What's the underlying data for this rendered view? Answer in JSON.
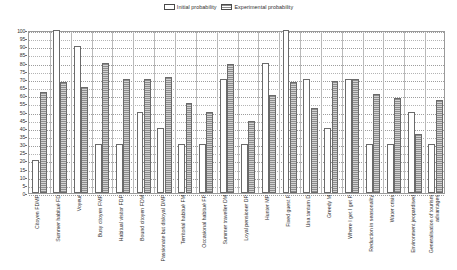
{
  "legend": {
    "position": "top-center",
    "entries": [
      {
        "label": "Initial probability",
        "swatch": "initial",
        "icon": "legend-swatch-icon"
      },
      {
        "label": "Experimental probability",
        "swatch": "experimental",
        "icon": "legend-swatch-icon"
      }
    ]
  },
  "chart_data": {
    "type": "bar",
    "title": "",
    "subtitle": "",
    "xlabel": "",
    "ylabel": "",
    "ylim": [
      0,
      100
    ],
    "ytick_step": 5,
    "grid": true,
    "legend_position": "top-center",
    "yticks": [
      "0",
      "5",
      "10",
      "15",
      "20",
      "25",
      "30",
      "35",
      "40",
      "45",
      "50",
      "55",
      "60",
      "65",
      "70",
      "75",
      "80",
      "85",
      "90",
      "95",
      "100"
    ],
    "categories": [
      "Citoyen FDMP",
      "Summer habitué FD",
      "Voyeur",
      "Busy citoyen FMP",
      "Habitual  visitor FDP",
      "Bound citoyen FDM",
      "Passionate but disloyal DMP",
      "Territorial habitué FM",
      "Occasional  habitué FP",
      "Summer  traveller DM",
      "Loyal pensioner DP",
      "Hunter MP",
      "Fixed guest F",
      "Una tantum  D",
      "Greedy M",
      "Where I get I get P",
      "Reduction in seasonality",
      "Water crisis",
      "Environment jeopardised",
      "Generalisation of tourism advantages"
    ],
    "series": [
      {
        "name": "Initial probability",
        "values": [
          20,
          100,
          90,
          30,
          30,
          50,
          40,
          30,
          30,
          70,
          30,
          80,
          100,
          70,
          40,
          70,
          30,
          30,
          50,
          30
        ]
      },
      {
        "name": "Experimental probability",
        "values": [
          62,
          68,
          65,
          80,
          70,
          70,
          71,
          55,
          50,
          79,
          44,
          60,
          68,
          52,
          69,
          70,
          61,
          58,
          36,
          57
        ]
      }
    ]
  }
}
